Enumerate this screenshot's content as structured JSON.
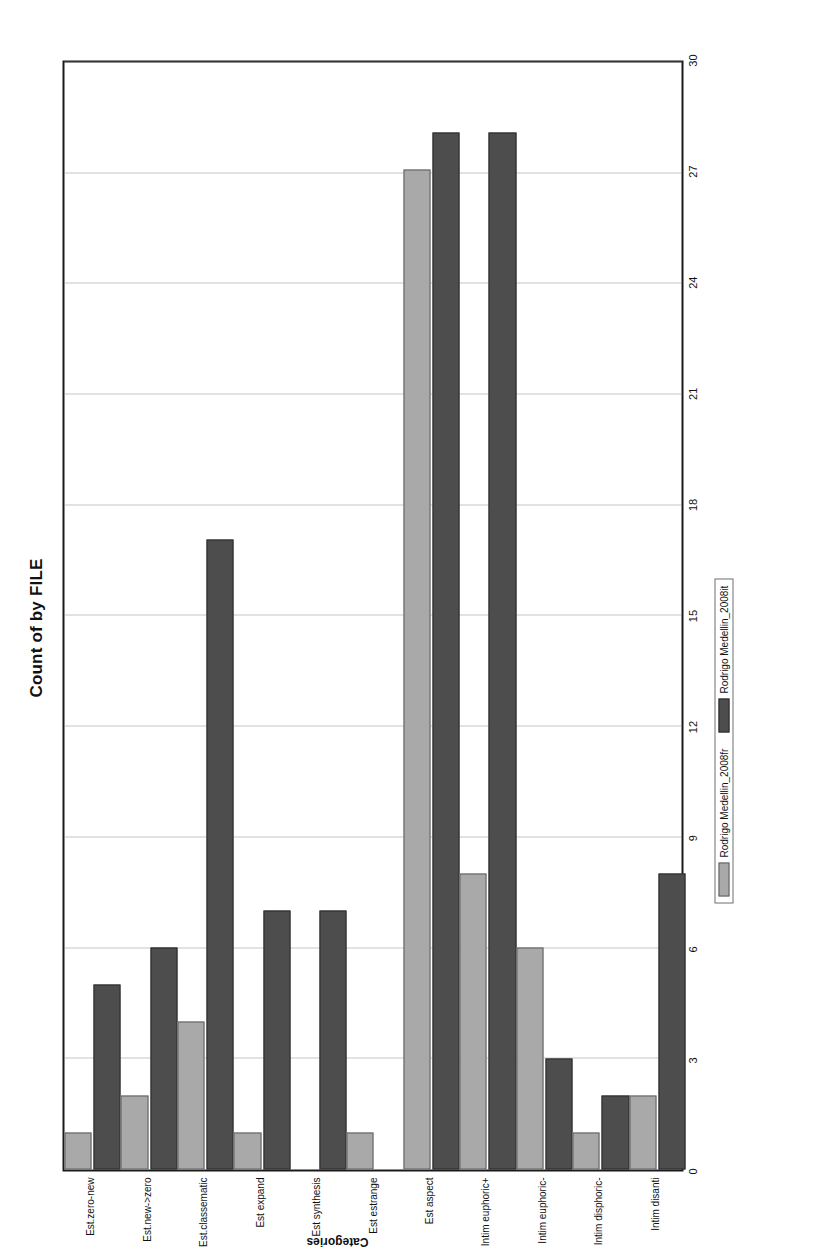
{
  "chart_data": {
    "type": "bar",
    "orientation": "horizontal",
    "title": "Count of by FILE",
    "xlabel": "Categories",
    "ylabel": "Count",
    "ylim": [
      0,
      30
    ],
    "yticks": [
      0,
      3,
      6,
      9,
      12,
      15,
      18,
      21,
      24,
      27,
      30
    ],
    "grid": true,
    "legend_position": "bottom-center",
    "categories": [
      "Est.zero-new",
      "Est.new->zero",
      "Est.classematic",
      "Est expand",
      "Est synthesis",
      "Est estrange",
      "Est aspect",
      "Intim euphoric+",
      "Intim euphoric-",
      "Intim disphoric-",
      "Intim disanti"
    ],
    "series": [
      {
        "name": "Rodrigo Medellin_2008fr",
        "color": "#a9a9a9",
        "values": [
          1,
          2,
          4,
          1,
          0,
          1,
          27,
          8,
          6,
          1,
          2
        ]
      },
      {
        "name": "Rodrigo Medellin_2008it",
        "color": "#4d4d4d",
        "values": [
          5,
          6,
          17,
          7,
          7,
          0,
          28,
          28,
          3,
          2,
          8
        ]
      }
    ]
  },
  "legend": {
    "items": [
      {
        "label": "Rodrigo Medellin_2008fr",
        "swatch": "light-gray-swatch"
      },
      {
        "label": "Rodrigo Medellin_2008it",
        "swatch": "dark-gray-swatch"
      }
    ]
  }
}
